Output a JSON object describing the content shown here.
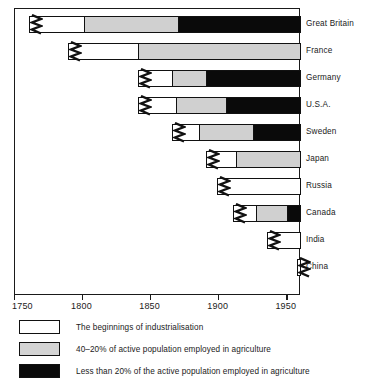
{
  "chart_data": {
    "type": "bar",
    "title": "",
    "subtitle": "",
    "xlabel": "",
    "ylabel": "",
    "orientation": "horizontal",
    "stacked": true,
    "grid": false,
    "xlim": [
      1750,
      1960
    ],
    "xticks": [
      1750,
      1800,
      1850,
      1900,
      1950
    ],
    "xtick_labels": [
      "1750",
      "1800",
      "1850",
      "1900",
      "1950"
    ],
    "legend_position": "below-axis",
    "categories": [
      "Great Britain",
      "France",
      "Germany",
      "U.S.A.",
      "Sweden",
      "Japan",
      "Russia",
      "Canada",
      "India",
      "China"
    ],
    "series": [
      {
        "name": "The beginnings of industrialisation",
        "color": "#ffffff",
        "spans": [
          [
            1760,
            1800
          ],
          [
            1789,
            1840
          ],
          [
            1840,
            1865
          ],
          [
            1840,
            1868
          ],
          [
            1865,
            1885
          ],
          [
            1890,
            1912
          ],
          [
            1898,
            1960
          ],
          [
            1910,
            1927
          ],
          [
            1935,
            1960
          ],
          [
            1957,
            1960
          ]
        ]
      },
      {
        "name": "40–20% of active population employed in agriculture",
        "color": "#d0d0d0",
        "spans": [
          [
            1800,
            1870
          ],
          [
            1840,
            1960
          ],
          [
            1865,
            1890
          ],
          [
            1868,
            1905
          ],
          [
            1885,
            1925
          ],
          [
            1912,
            1960
          ],
          null,
          [
            1927,
            1950
          ],
          null,
          null
        ]
      },
      {
        "name": "Less than 20% of the active population employed in agriculture",
        "color": "#0a0a0a",
        "spans": [
          [
            1870,
            1960
          ],
          null,
          [
            1890,
            1960
          ],
          [
            1905,
            1960
          ],
          [
            1925,
            1960
          ],
          null,
          null,
          [
            1950,
            1960
          ],
          null,
          null
        ]
      }
    ]
  },
  "axis": {
    "ticks": [
      {
        "value": 1750,
        "label": "1750"
      },
      {
        "value": 1800,
        "label": "1800"
      },
      {
        "value": 1850,
        "label": "1850"
      },
      {
        "value": 1900,
        "label": "1900"
      },
      {
        "value": 1950,
        "label": "1950"
      }
    ]
  },
  "countries": [
    {
      "label": "Great Britain"
    },
    {
      "label": "France"
    },
    {
      "label": "Germany"
    },
    {
      "label": "U.S.A."
    },
    {
      "label": "Sweden"
    },
    {
      "label": "Japan"
    },
    {
      "label": "Russia"
    },
    {
      "label": "Canada"
    },
    {
      "label": "India"
    },
    {
      "label": "China"
    }
  ],
  "legend": {
    "items": [
      {
        "swatch": "white",
        "label": "The beginnings of industrialisation"
      },
      {
        "swatch": "gray",
        "label": "40–20% of active population employed in agriculture"
      },
      {
        "swatch": "black",
        "label": "Less than 20% of the active population employed in agriculture"
      }
    ]
  },
  "colors": {
    "white_segment": "#ffffff",
    "gray_segment": "#d0d0d0",
    "black_segment": "#0a0a0a",
    "line": "#1a1a1a",
    "background": "#ffffff"
  }
}
